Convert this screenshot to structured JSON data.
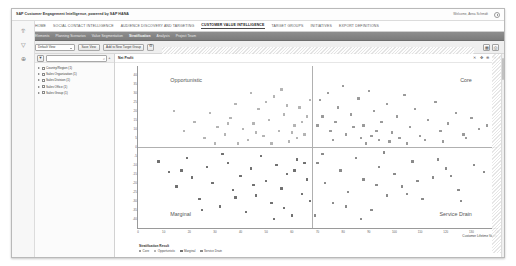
{
  "app": {
    "brand": "SAP Customer Engagement Intelligence, powered by SAP HANA",
    "user_greeting": "Welcome, Anna Schmidt",
    "power_icon": "power-icon"
  },
  "main_nav": {
    "items": [
      {
        "label": "HOME",
        "active": false
      },
      {
        "label": "SOCIAL CONTACT INTELLIGENCE",
        "active": false
      },
      {
        "label": "AUDIENCE DISCOVERY AND TARGETING",
        "active": false
      },
      {
        "label": "CUSTOMER VALUE INTELLIGENCE",
        "active": true
      },
      {
        "label": "TARGET GROUPS",
        "active": false
      },
      {
        "label": "INITIATIVES",
        "active": false
      },
      {
        "label": "EXPORT DEFINITIONS",
        "active": false
      }
    ]
  },
  "sub_nav": {
    "items": [
      {
        "label": "Elements",
        "active": false
      },
      {
        "label": "Planning Scenarios",
        "active": false
      },
      {
        "label": "Value Segmentation",
        "active": false
      },
      {
        "label": "Stratification",
        "active": true
      },
      {
        "label": "Analysis",
        "active": false
      },
      {
        "label": "Project Team",
        "active": false
      }
    ]
  },
  "toolbar": {
    "view_select_value": "Default View",
    "save_view_label": "Save View",
    "add_target_group_label": "Add to New Target Group",
    "settings_icon": "gear-icon",
    "right_icons": [
      {
        "name": "table-view-icon",
        "glyph": "▦"
      },
      {
        "name": "print-icon",
        "glyph": "⎙"
      }
    ]
  },
  "left_rail": {
    "icons": [
      {
        "name": "chart-bar-icon",
        "glyph": "⥣"
      },
      {
        "name": "filter-funnel-icon",
        "glyph": "▽"
      },
      {
        "name": "add-circle-icon",
        "glyph": "⊕"
      }
    ]
  },
  "sidebar": {
    "filter_icon": "filter-icon",
    "search_placeholder": "",
    "search_value": "",
    "search_icon": "search-icon",
    "add_icon": "plus-icon",
    "tree_items": [
      {
        "label": "Country/Region (1)"
      },
      {
        "label": "Sales Organization (1)"
      },
      {
        "label": "Sales Division (1)"
      },
      {
        "label": "Sales Office (1)"
      },
      {
        "label": "Sales Group (1)"
      }
    ]
  },
  "chart_panel": {
    "title": "Net Profit",
    "tools": [
      {
        "name": "reset-zoom-icon",
        "glyph": "✕"
      },
      {
        "name": "pan-icon",
        "glyph": "✥"
      },
      {
        "name": "zoom-in-icon",
        "glyph": "⊕"
      },
      {
        "name": "zoom-out-icon",
        "glyph": "⊖"
      },
      {
        "name": "info-icon",
        "glyph": "ℹ"
      }
    ]
  },
  "chart_data": {
    "type": "scatter",
    "title": "Net Profit",
    "xlabel": "Customer Lifetime Value",
    "ylabel": "Net Profit",
    "xlim": [
      0,
      140
    ],
    "ylim": [
      -45,
      45
    ],
    "grid": false,
    "legend_position": "bottom-left",
    "legend_title": "Stratification Result",
    "xticks": [
      0,
      10,
      20,
      30,
      40,
      50,
      60,
      70,
      80,
      90,
      100,
      110,
      120,
      130,
      140
    ],
    "yticks": [
      -40,
      -35,
      -30,
      -25,
      -20,
      -15,
      -10,
      -5,
      0,
      5,
      10,
      15,
      20,
      25,
      30,
      35,
      40
    ],
    "reference_lines": {
      "x": 68,
      "y": 0
    },
    "quadrants": [
      {
        "key": "opportunistic",
        "label": "Opportunistic",
        "position": "top-left"
      },
      {
        "key": "core",
        "label": "Core",
        "position": "top-right"
      },
      {
        "key": "marginal",
        "label": "Marginal",
        "position": "bottom-left"
      },
      {
        "key": "service_drain",
        "label": "Service Drain",
        "position": "bottom-right"
      }
    ],
    "series": [
      {
        "name": "Core",
        "color": "#9a9a9a",
        "points": [
          [
            71,
            26
          ],
          [
            74,
            30
          ],
          [
            78,
            22
          ],
          [
            80,
            34
          ],
          [
            83,
            18
          ],
          [
            86,
            27
          ],
          [
            88,
            12
          ],
          [
            90,
            31
          ],
          [
            92,
            20
          ],
          [
            95,
            14
          ],
          [
            97,
            24
          ],
          [
            99,
            8
          ],
          [
            101,
            17
          ],
          [
            104,
            29
          ],
          [
            106,
            11
          ],
          [
            108,
            21
          ],
          [
            110,
            6
          ],
          [
            113,
            15
          ],
          [
            116,
            25
          ],
          [
            118,
            9
          ],
          [
            121,
            13
          ],
          [
            124,
            19
          ],
          [
            127,
            7
          ],
          [
            130,
            16
          ],
          [
            133,
            10
          ],
          [
            136,
            12
          ],
          [
            70,
            12
          ],
          [
            72,
            17
          ],
          [
            75,
            9
          ],
          [
            77,
            14
          ],
          [
            81,
            7
          ],
          [
            84,
            11
          ],
          [
            87,
            5
          ],
          [
            91,
            6
          ],
          [
            94,
            4
          ],
          [
            98,
            3
          ],
          [
            102,
            5
          ],
          [
            105,
            2
          ],
          [
            112,
            4
          ],
          [
            119,
            3
          ],
          [
            128,
            5
          ],
          [
            76,
            4
          ],
          [
            89,
            2
          ],
          [
            93,
            9
          ]
        ]
      },
      {
        "name": "Opportunistic",
        "color": "#b4b4b4",
        "points": [
          [
            14,
            20
          ],
          [
            18,
            9
          ],
          [
            22,
            14
          ],
          [
            26,
            5
          ],
          [
            28,
            19
          ],
          [
            31,
            11
          ],
          [
            34,
            7
          ],
          [
            36,
            16
          ],
          [
            38,
            24
          ],
          [
            41,
            10
          ],
          [
            43,
            4
          ],
          [
            45,
            13
          ],
          [
            47,
            21
          ],
          [
            49,
            6
          ],
          [
            51,
            15
          ],
          [
            53,
            28
          ],
          [
            55,
            9
          ],
          [
            57,
            18
          ],
          [
            59,
            3
          ],
          [
            61,
            12
          ],
          [
            63,
            22
          ],
          [
            65,
            7
          ],
          [
            66,
            17
          ],
          [
            67,
            26
          ],
          [
            44,
            30
          ],
          [
            50,
            25
          ],
          [
            56,
            32
          ],
          [
            60,
            8
          ],
          [
            62,
            5
          ],
          [
            64,
            14
          ],
          [
            30,
            2
          ],
          [
            39,
            2
          ],
          [
            52,
            2
          ],
          [
            58,
            23
          ],
          [
            46,
            8
          ],
          [
            35,
            13
          ]
        ]
      },
      {
        "name": "Marginal",
        "color": "#707070",
        "points": [
          [
            8,
            -8
          ],
          [
            12,
            -14
          ],
          [
            15,
            -22
          ],
          [
            19,
            -6
          ],
          [
            21,
            -17
          ],
          [
            24,
            -29
          ],
          [
            27,
            -11
          ],
          [
            29,
            -20
          ],
          [
            32,
            -33
          ],
          [
            35,
            -9
          ],
          [
            37,
            -24
          ],
          [
            40,
            -16
          ],
          [
            42,
            -36
          ],
          [
            44,
            -12
          ],
          [
            46,
            -27
          ],
          [
            48,
            -5
          ],
          [
            50,
            -19
          ],
          [
            52,
            -31
          ],
          [
            54,
            -10
          ],
          [
            56,
            -23
          ],
          [
            58,
            -15
          ],
          [
            60,
            -38
          ],
          [
            62,
            -7
          ],
          [
            64,
            -26
          ],
          [
            66,
            -18
          ],
          [
            67,
            -30
          ],
          [
            33,
            -4
          ],
          [
            25,
            -35
          ],
          [
            17,
            -13
          ],
          [
            53,
            -40
          ],
          [
            45,
            -21
          ],
          [
            38,
            -28
          ],
          [
            57,
            -34
          ],
          [
            61,
            -13
          ],
          [
            65,
            -9
          ]
        ]
      },
      {
        "name": "Service Drain",
        "color": "#8a8a8a",
        "points": [
          [
            70,
            -9
          ],
          [
            73,
            -20
          ],
          [
            76,
            -31
          ],
          [
            79,
            -13
          ],
          [
            82,
            -25
          ],
          [
            85,
            -6
          ],
          [
            88,
            -18
          ],
          [
            91,
            -35
          ],
          [
            94,
            -11
          ],
          [
            97,
            -27
          ],
          [
            100,
            -15
          ],
          [
            103,
            -22
          ],
          [
            107,
            -8
          ],
          [
            111,
            -29
          ],
          [
            115,
            -17
          ],
          [
            120,
            -12
          ],
          [
            125,
            -24
          ],
          [
            131,
            -10
          ],
          [
            69,
            -38
          ],
          [
            87,
            -40
          ],
          [
            72,
            -4
          ],
          [
            96,
            -3
          ],
          [
            109,
            -19
          ],
          [
            117,
            -7
          ],
          [
            122,
            -16
          ],
          [
            126,
            -30
          ],
          [
            135,
            -14
          ],
          [
            81,
            -33
          ],
          [
            93,
            -21
          ],
          [
            105,
            -26
          ]
        ]
      }
    ]
  },
  "scrollbar": {
    "name": "vertical-scrollbar"
  }
}
